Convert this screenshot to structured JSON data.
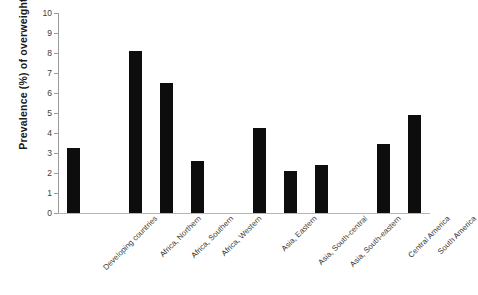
{
  "chart_data": {
    "type": "bar",
    "title": "",
    "subtitle": "",
    "xlabel": "",
    "ylabel": "Prevalence (%) of overweight",
    "ylim": [
      0,
      10
    ],
    "ytick_values": [
      0,
      1,
      2,
      3,
      4,
      5,
      6,
      7,
      8,
      9,
      10
    ],
    "ytick_labels": [
      "0",
      "1",
      "2",
      "3",
      "4",
      "5",
      "6",
      "7",
      "8",
      "9",
      "10"
    ],
    "grid": false,
    "legend": null,
    "bar_color": "#0d0d0d",
    "axis_color": "#9a9a9a",
    "categories": [
      "Developing countries",
      "Africa, Northern",
      "Africa, Southern",
      "Africa, Western",
      "Asia, Eastern",
      "Asia, South-central",
      "Asia, South-eastern",
      "Central America",
      "South America"
    ],
    "values": [
      3.25,
      8.1,
      6.5,
      2.6,
      4.25,
      2.1,
      2.4,
      3.45,
      4.9
    ],
    "slots": [
      {
        "kind": "bar",
        "label": "Developing countries",
        "value": 3.25
      },
      {
        "kind": "gap",
        "label": "",
        "value": null
      },
      {
        "kind": "bar",
        "label": "Africa, Northern",
        "value": 8.1
      },
      {
        "kind": "bar",
        "label": "Africa, Southern",
        "value": 6.5
      },
      {
        "kind": "bar",
        "label": "Africa, Western",
        "value": 2.6
      },
      {
        "kind": "gap",
        "label": "",
        "value": null
      },
      {
        "kind": "bar",
        "label": "Asia, Eastern",
        "value": 4.25
      },
      {
        "kind": "bar",
        "label": "Asia, South-central",
        "value": 2.1
      },
      {
        "kind": "bar",
        "label": "Asia, South-eastern",
        "value": 2.4
      },
      {
        "kind": "gap",
        "label": "",
        "value": null
      },
      {
        "kind": "bar",
        "label": "Central America",
        "value": 3.45
      },
      {
        "kind": "bar",
        "label": "South America",
        "value": 4.9
      }
    ]
  }
}
